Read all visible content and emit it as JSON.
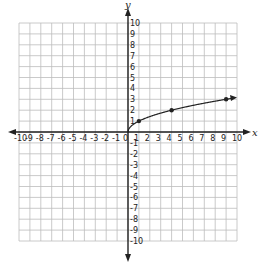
{
  "chart_data": {
    "type": "line",
    "title": "",
    "xlabel": "x",
    "ylabel": "y",
    "xlim": [
      -10,
      10
    ],
    "ylim": [
      -10,
      10
    ],
    "grid": true,
    "x_ticks": [
      -10,
      -9,
      -8,
      -7,
      -6,
      -5,
      -4,
      -3,
      -2,
      -1,
      0,
      1,
      2,
      3,
      4,
      5,
      6,
      7,
      8,
      9,
      10
    ],
    "y_ticks": [
      -10,
      -9,
      -8,
      -7,
      -6,
      -5,
      -4,
      -3,
      -2,
      -1,
      1,
      2,
      3,
      4,
      5,
      6,
      7,
      8,
      9,
      10
    ],
    "series": [
      {
        "name": "y = sqrt(x)",
        "function": "sqrt",
        "x_start": 0,
        "x_end": 10,
        "end_arrow": true,
        "marked_points": [
          [
            1,
            1
          ],
          [
            4,
            2
          ],
          [
            9,
            3
          ]
        ]
      }
    ]
  },
  "colors": {
    "grid": "#bdbdbd",
    "axis": "#222222",
    "curve": "#222222"
  }
}
